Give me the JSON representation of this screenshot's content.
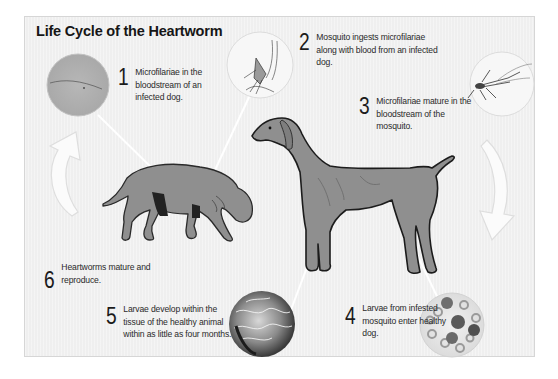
{
  "diagram": {
    "title": "Life Cycle of the Heartworm",
    "steps": [
      {
        "number": "1",
        "text": "Microfilariae in the bloodstream of an infected dog."
      },
      {
        "number": "2",
        "text": "Mosquito ingests microfilariae along with blood from an infected dog."
      },
      {
        "number": "3",
        "text": "Microfilariae mature in the bloodstream of the mosquito."
      },
      {
        "number": "4",
        "text": "Larvae from infested mosquito enter healthy dog."
      },
      {
        "number": "5",
        "text": "Larvae develop within the tissue of the healthy animal within as little as four months."
      },
      {
        "number": "6",
        "text": "Heartworms mature and reproduce."
      }
    ],
    "illustrations": {
      "infected_dog": "sick-dog-illustration",
      "healthy_dog": "healthy-dog-illustration",
      "microfilariae_circle": "microscope-microfilariae-circle",
      "mosquito_feeding_circle": "mosquito-feeding-circle",
      "mosquito_circle": "mosquito-circle",
      "blood_cells_circle": "blood-cells-larvae-circle",
      "worms_tissue_circle": "heartworms-tissue-circle",
      "cycle_arrows": [
        "curved-arrow-up-left",
        "curved-arrow-down-right"
      ]
    },
    "colors": {
      "panel_bg": "#efefef",
      "dog_fill": "#8f8f8f",
      "dog_outline": "#1e1e1e",
      "pointer_line": "#ffffff",
      "text": "#1a1a1a"
    }
  }
}
